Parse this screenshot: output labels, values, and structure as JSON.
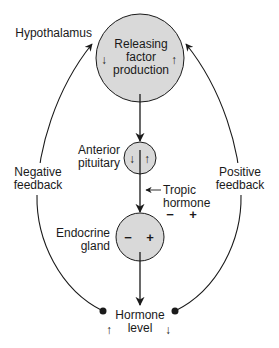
{
  "diagram": {
    "colors": {
      "node_fill": "#d9d9d9",
      "stroke": "#1a1a1a",
      "background": "#ffffff"
    },
    "nodes": {
      "hypothalamus": {
        "label": "Hypothalamus",
        "inner_lines": [
          "Releasing",
          "factor",
          "production"
        ],
        "left_arrow": "↓",
        "right_arrow": "↑"
      },
      "anterior_pituitary": {
        "label_lines": [
          "Anterior",
          "pituitary"
        ],
        "left_arrow": "↓",
        "right_arrow": "↑"
      },
      "endocrine_gland": {
        "label_lines": [
          "Endocrine",
          "gland"
        ],
        "minus": "−",
        "plus": "+"
      },
      "hormone_level": {
        "label_lines": [
          "Hormone",
          "level"
        ],
        "left_arrow": "↑",
        "right_arrow": "↓"
      }
    },
    "edges": {
      "tropic_hormone": {
        "label_lines": [
          "Tropic",
          "hormone"
        ],
        "minus": "−",
        "plus": "+"
      },
      "negative_feedback": {
        "label_lines": [
          "Negative",
          "feedback"
        ]
      },
      "positive_feedback": {
        "label_lines": [
          "Positive",
          "feedback"
        ]
      }
    }
  }
}
